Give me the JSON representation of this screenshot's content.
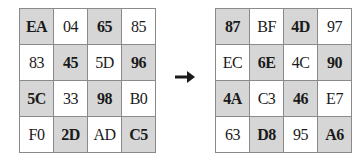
{
  "diagram": {
    "left_grid": {
      "cells": [
        [
          "EA",
          "04",
          "65",
          "85"
        ],
        [
          "83",
          "45",
          "5D",
          "96"
        ],
        [
          "5C",
          "33",
          "98",
          "B0"
        ],
        [
          "F0",
          "2D",
          "AD",
          "C5"
        ]
      ]
    },
    "right_grid": {
      "cells": [
        [
          "87",
          "BF",
          "4D",
          "97"
        ],
        [
          "EC",
          "6E",
          "4C",
          "90"
        ],
        [
          "4A",
          "C3",
          "46",
          "E7"
        ],
        [
          "63",
          "D8",
          "95",
          "A6"
        ]
      ]
    },
    "arrow": "right-arrow-icon",
    "colors": {
      "shaded": "#d6d6d6",
      "border": "#8a8a8a",
      "text": "#1a1a1a"
    }
  }
}
